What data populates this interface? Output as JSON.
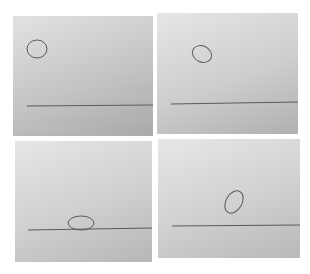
{
  "figure": {
    "background": "#ffffff",
    "panels": [
      {
        "id": "top-left",
        "rect": [
          13,
          16,
          140,
          120
        ],
        "gradient": [
          "#e2e2e2",
          "#c4c4c4",
          "#a9a9a9"
        ],
        "line": {
          "x1": 14,
          "y1": 90,
          "x2": 140,
          "y2": 89
        },
        "ellipse": {
          "cx": 24,
          "cy": 33,
          "rx": 10,
          "ry": 9,
          "rotate": 0
        }
      },
      {
        "id": "top-right",
        "rect": [
          157,
          13,
          141,
          121
        ],
        "gradient": [
          "#e6e6e6",
          "#cdcdcd",
          "#b0b0b0"
        ],
        "line": {
          "x1": 14,
          "y1": 91,
          "x2": 141,
          "y2": 89
        },
        "ellipse": {
          "cx": 45,
          "cy": 41,
          "rx": 10,
          "ry": 8,
          "rotate": 25
        }
      },
      {
        "id": "bottom-left",
        "rect": [
          15,
          141,
          137,
          121
        ],
        "gradient": [
          "#e6e6e6",
          "#cfcfcf",
          "#b6b6b6"
        ],
        "line": {
          "x1": 13,
          "y1": 89,
          "x2": 137,
          "y2": 87
        },
        "ellipse": {
          "cx": 66,
          "cy": 82,
          "rx": 13,
          "ry": 7,
          "rotate": 0
        }
      },
      {
        "id": "bottom-right",
        "rect": [
          158,
          139,
          142,
          119
        ],
        "gradient": [
          "#e7e7e7",
          "#d0d0d0",
          "#b8b8b8"
        ],
        "line": {
          "x1": 14,
          "y1": 87,
          "x2": 142,
          "y2": 86
        },
        "ellipse": {
          "cx": 76,
          "cy": 63,
          "rx": 8,
          "ry": 12,
          "rotate": 30
        }
      }
    ],
    "stroke_color": "#5a5a5a"
  }
}
